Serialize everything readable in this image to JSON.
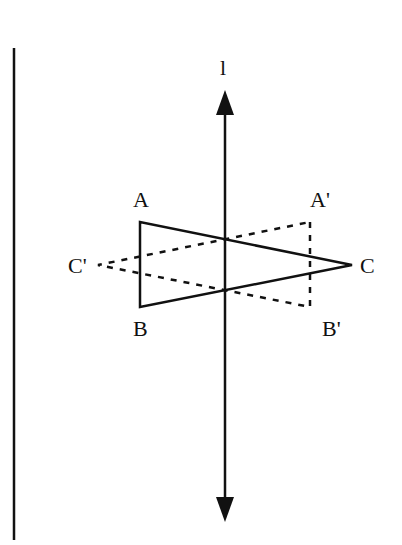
{
  "diagram": {
    "type": "reflection-across-line",
    "axis_label": "l",
    "labels": {
      "A": "A",
      "B": "B",
      "C": "C",
      "A_prime": "A'",
      "B_prime": "B'",
      "C_prime": "C'"
    },
    "original_triangle": [
      "A",
      "B",
      "C"
    ],
    "reflected_triangle": [
      "A'",
      "B'",
      "C'"
    ],
    "styles": {
      "original": "solid",
      "reflected": "dashed",
      "stroke_color": "#111111"
    }
  }
}
